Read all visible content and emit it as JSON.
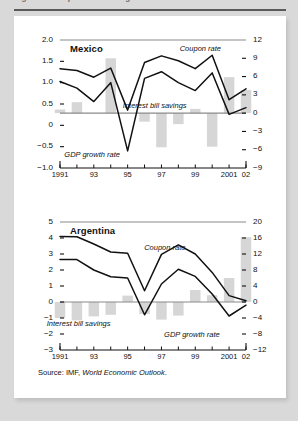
{
  "figure": {
    "cut_title": "Figure 3. Coupon rates and growth rates",
    "source_prefix": "Source: IMF,",
    "source_italic": "World Economic Outlook",
    "source_suffix": "."
  },
  "chart_data": [
    {
      "type": "line",
      "title": "Mexico",
      "xlabel": "",
      "ylabel": "",
      "grid": false,
      "legend": "annotations",
      "x": [
        1991,
        1992,
        1993,
        1994,
        1995,
        1996,
        1997,
        1998,
        1999,
        2000,
        2001,
        2002
      ],
      "xtick_labels": [
        "1991",
        "",
        "93",
        "",
        "95",
        "",
        "97",
        "",
        "99",
        "",
        "2001",
        "02"
      ],
      "left_axis": {
        "name": "GDP growth rate",
        "ticks": [
          "2.0",
          "1.5",
          "1.0",
          "0.5",
          "0",
          "-0.5",
          "-1.0"
        ],
        "ylim": [
          -1.0,
          2.0
        ]
      },
      "right_axis": {
        "name": "Coupon rate / Interest bill savings",
        "ticks": [
          "12",
          "9",
          "6",
          "3",
          "0",
          "-3",
          "-6",
          "-9"
        ],
        "ylim": [
          -9,
          12
        ]
      },
      "series": [
        {
          "name": "Coupon rate",
          "axis": "right",
          "style": "line",
          "values": [
            7.3,
            7.0,
            5.9,
            7.4,
            0.5,
            8.3,
            9.4,
            8.6,
            7.3,
            9.5,
            2.2,
            4.0
          ]
        },
        {
          "name": "GDP growth rate",
          "axis": "right",
          "style": "line",
          "values": [
            5.2,
            4.1,
            1.9,
            5.0,
            -6.2,
            5.7,
            6.8,
            5.0,
            3.7,
            6.6,
            -0.2,
            0.9
          ]
        },
        {
          "name": "Interest bill savings",
          "axis": "right",
          "style": "bar",
          "values": [
            0.6,
            1.8,
            0.0,
            9.0,
            0.0,
            -1.4,
            -5.6,
            -1.8,
            0.7,
            -5.5,
            5.9,
            3.8
          ]
        }
      ],
      "annotations": [
        {
          "text": "Coupon rate",
          "x": 1999.3,
          "y": 10.6
        },
        {
          "text": "Interest bill savings",
          "x": 1996.6,
          "y": 1.1
        },
        {
          "text": "GDP growth rate",
          "x": 1992.9,
          "y": -6.9
        }
      ]
    },
    {
      "type": "line",
      "title": "Argentina",
      "xlabel": "",
      "ylabel": "",
      "grid": false,
      "legend": "annotations",
      "x": [
        1991,
        1992,
        1993,
        1994,
        1995,
        1996,
        1997,
        1998,
        1999,
        2000,
        2001,
        2002
      ],
      "xtick_labels": [
        "1991",
        "",
        "93",
        "",
        "95",
        "",
        "97",
        "",
        "99",
        "",
        "2001",
        "02"
      ],
      "left_axis": {
        "name": "GDP growth rate",
        "ticks": [
          "5",
          "4",
          "3",
          "2",
          "1",
          "0",
          "-1",
          "-2",
          "-3"
        ],
        "ylim": [
          -3,
          5
        ]
      },
      "right_axis": {
        "name": "Coupon rate / Interest bill savings",
        "ticks": [
          "20",
          "16",
          "12",
          "8",
          "4",
          "0",
          "-4",
          "-8",
          "-12"
        ],
        "ylim": [
          -12,
          20
        ]
      },
      "series": [
        {
          "name": "Coupon rate",
          "axis": "right",
          "style": "line",
          "values": [
            16.4,
            16.3,
            14.5,
            12.5,
            12.2,
            2.8,
            11.9,
            14.3,
            12.0,
            7.4,
            1.6,
            0.3
          ]
        },
        {
          "name": "GDP growth rate",
          "axis": "right",
          "style": "line",
          "values": [
            10.6,
            10.6,
            8.0,
            6.3,
            6.0,
            -3.2,
            4.5,
            8.2,
            6.4,
            2.0,
            -3.5,
            -0.8
          ]
        },
        {
          "name": "Interest bill savings",
          "axis": "right",
          "style": "bar",
          "values": [
            -4.0,
            -4.6,
            -3.6,
            -3.2,
            1.6,
            -3.0,
            -4.4,
            -3.4,
            3.0,
            1.7,
            6.0,
            16.2
          ]
        }
      ],
      "annotations": [
        {
          "text": "Coupon rate",
          "x": 1997.2,
          "y": 13.6
        },
        {
          "text": "Interest bill savings",
          "x": 1992.1,
          "y": -5.6
        },
        {
          "text": "GDP growth rate",
          "x": 1998.8,
          "y": -8.2
        }
      ]
    }
  ],
  "colors": {
    "bar": "#d6d6d6",
    "line": "#111111",
    "axis": "#8a8a8a",
    "text": "#111111",
    "page_bg": "#d9d9d9",
    "card_bg": "#ffffff"
  }
}
